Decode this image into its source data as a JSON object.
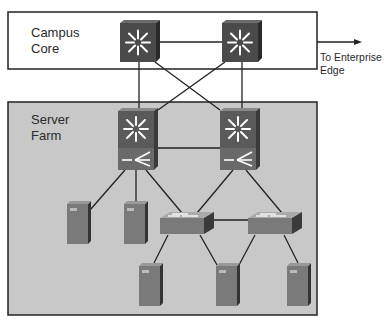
{
  "campus_core": {
    "line1": "Campus",
    "line2": "Core"
  },
  "server_farm": {
    "line1": "Server",
    "line2": "Farm"
  },
  "external": {
    "line1": "To Enterprise",
    "line2": "Edge"
  },
  "colors": {
    "core_box_fill": "#ffffff",
    "farm_box_fill": "#c8c8c8",
    "box_border": "#222222",
    "switch_front": "#4a4a4a",
    "switch_side": "#2a2a2a",
    "server_front": "#7a7a7a",
    "server_side": "#3a3a3a",
    "access_switch_top": "#aaaaaa",
    "link": "#222222"
  }
}
